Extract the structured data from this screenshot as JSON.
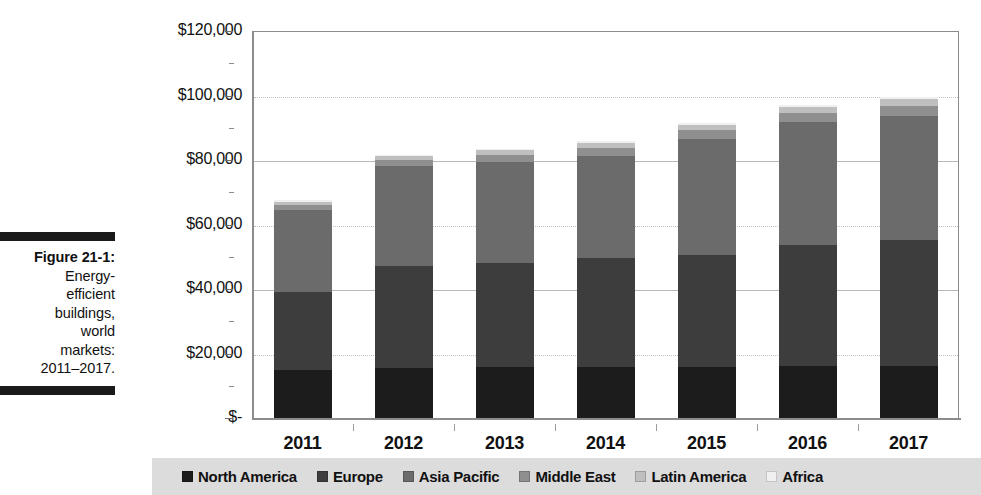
{
  "figure": {
    "number_label": "Figure 21-1:",
    "caption_lines": [
      "Energy-",
      "efficient",
      "buildings,",
      "world",
      "markets:",
      "2011–2017."
    ]
  },
  "chart_data": {
    "type": "bar",
    "variant": "stacked",
    "title": "",
    "xlabel": "",
    "ylabel": "($ Millions)",
    "ylim": [
      0,
      120000
    ],
    "ytick_values": [
      0,
      20000,
      40000,
      60000,
      80000,
      100000,
      120000
    ],
    "ytick_labels": [
      "$-",
      "$20,000",
      "$40,000",
      "$60,000",
      "$80,000",
      "$100,000",
      "$120,000"
    ],
    "grid": true,
    "legend_position": "bottom",
    "categories": [
      "2011",
      "2012",
      "2013",
      "2014",
      "2015",
      "2016",
      "2017"
    ],
    "series": [
      {
        "name": "North America",
        "color": "#1c1c1c",
        "values": [
          15000,
          15500,
          15800,
          15800,
          15800,
          16000,
          16200
        ]
      },
      {
        "name": "Europe",
        "color": "#3d3d3d",
        "values": [
          24000,
          31500,
          32300,
          33700,
          34700,
          37800,
          39100
        ]
      },
      {
        "name": "Asia Pacific",
        "color": "#6b6b6b",
        "values": [
          25500,
          31000,
          31200,
          31800,
          36000,
          38000,
          38500
        ]
      },
      {
        "name": "Middle East",
        "color": "#8f8f8f",
        "values": [
          1600,
          2000,
          2300,
          2500,
          2700,
          2900,
          3100
        ]
      },
      {
        "name": "Latin America",
        "color": "#bfbfbf",
        "values": [
          1000,
          1200,
          1400,
          1500,
          1700,
          1800,
          1900
        ]
      },
      {
        "name": "Africa",
        "color": "#f0f0f0",
        "values": [
          400,
          500,
          550,
          600,
          650,
          700,
          750
        ]
      }
    ],
    "totals": [
      67500,
      81700,
      83550,
      85900,
      91550,
      97200,
      99550
    ]
  }
}
